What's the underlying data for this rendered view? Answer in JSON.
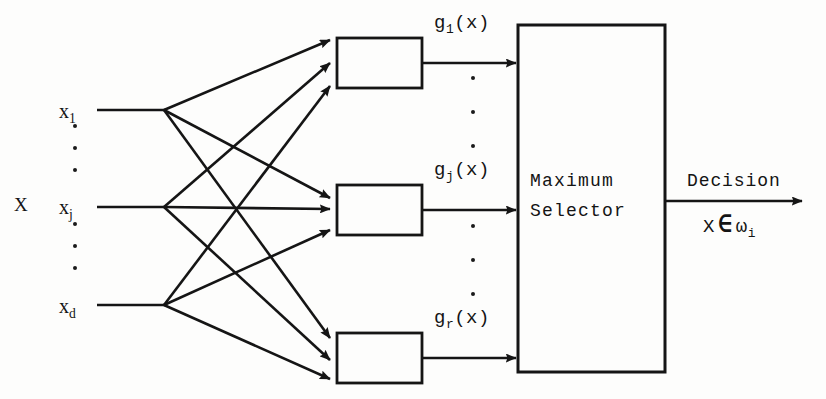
{
  "diagram": {
    "type": "block-diagram",
    "stroke_color": "#151515",
    "background_color": "#fdfdfc"
  },
  "inputs": {
    "vector_label": "X",
    "nodes": [
      {
        "id": "x1",
        "base": "x",
        "subscript": "1"
      },
      {
        "id": "xj",
        "base": "x",
        "subscript": "j"
      },
      {
        "id": "xd",
        "base": "x",
        "subscript": "d"
      }
    ],
    "ellipsis_glyph": "."
  },
  "discriminants": {
    "boxes": [
      {
        "id": "g1",
        "label_base": "g",
        "label_sub": "1",
        "label_arg": "(x)",
        "label_full": "g1(x)"
      },
      {
        "id": "gj",
        "label_base": "g",
        "label_sub": "j",
        "label_arg": "(x)",
        "label_full": "gj(x)"
      },
      {
        "id": "gr",
        "label_base": "g",
        "label_sub": "r",
        "label_arg": "(x)",
        "label_full": "gr(x)"
      }
    ],
    "ellipsis_glyph": "."
  },
  "selector": {
    "line1": "Maximum",
    "line2": "Selector"
  },
  "output": {
    "label": "Decision",
    "membership_x": "X",
    "membership_symbol": "∈",
    "membership_class_base": "ω",
    "membership_class_sub": "i",
    "membership_full": "X ∈ ωi"
  }
}
